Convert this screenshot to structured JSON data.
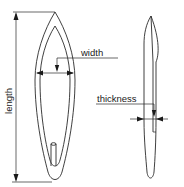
{
  "diagram": {
    "labels": {
      "length": "length",
      "width": "width",
      "thickness": "thickness"
    },
    "views": [
      {
        "name": "front-view",
        "description": "elongated leaf/blade outline with inner outline and small rod"
      },
      {
        "name": "side-view",
        "description": "narrow profile showing thickness"
      }
    ],
    "colors": {
      "line": "#2a2a2a",
      "background": "#ffffff"
    }
  }
}
